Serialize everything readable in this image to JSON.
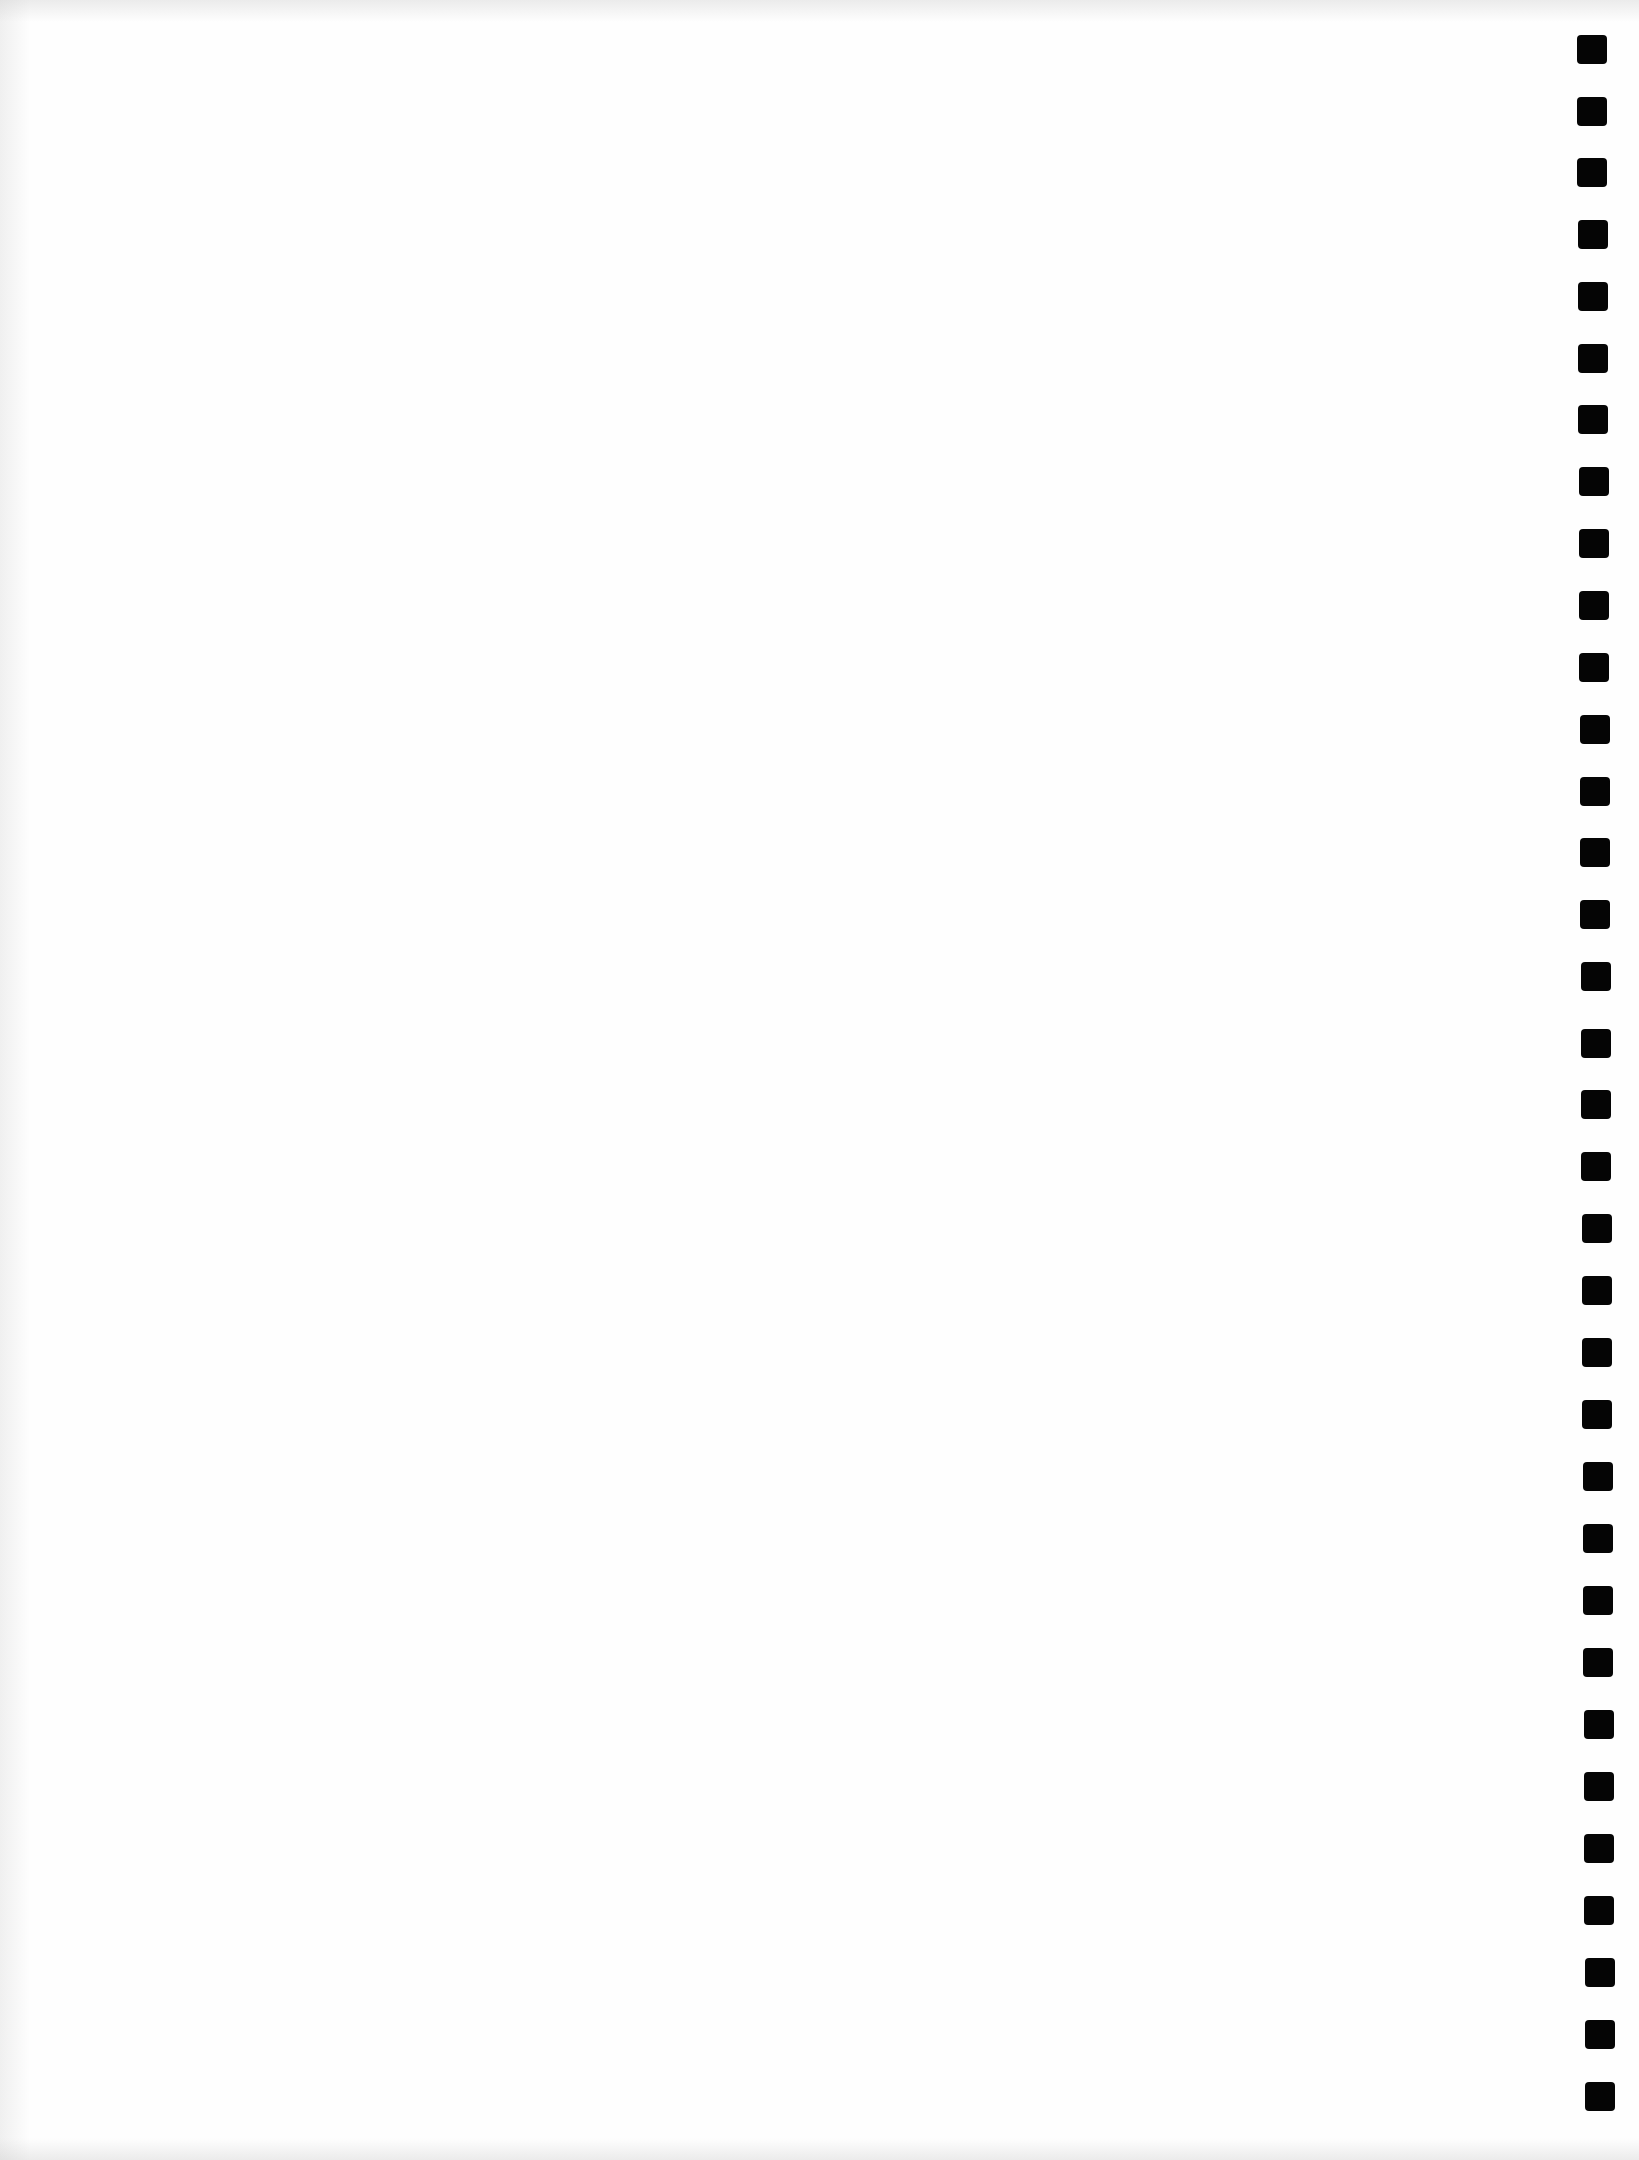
{
  "document": {
    "type": "blank scanned page",
    "background_color": "#fefefe",
    "text_content": ""
  },
  "marker_strip": {
    "side": "right",
    "count": 34,
    "color": "#050505",
    "marker_size": [
      30,
      29
    ],
    "marker_tops": [
      35,
      97,
      158,
      220,
      282,
      344,
      405,
      467,
      529,
      591,
      653,
      715,
      777,
      838,
      900,
      962,
      1029,
      1090,
      1152,
      1214,
      1276,
      1338,
      1400,
      1462,
      1524,
      1586,
      1648,
      1710,
      1772,
      1834,
      1896,
      1958,
      2020,
      2082
    ],
    "marker_lefts_start": 1577,
    "marker_lefts_end": 1585
  }
}
